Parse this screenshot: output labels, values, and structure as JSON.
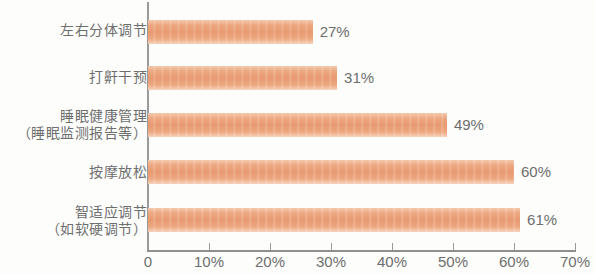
{
  "chart_data": {
    "type": "bar",
    "orientation": "horizontal",
    "title": "",
    "subtitle": "",
    "xlabel": "",
    "ylabel": "",
    "xlim": [
      0,
      70
    ],
    "grid": false,
    "legend": false,
    "bar_color": "#e89a70",
    "text_color": "#6e6e6e",
    "axis_color": "#9a9a9a",
    "background_color": "#fdfdfc",
    "categories": [
      "左右分体调节",
      "打鼾干预",
      "睡眠健康管理（睡眠监测报告等）",
      "按摩放松",
      "智适应调节（如软硬调节）"
    ],
    "category_lines": [
      [
        "左右分体调节"
      ],
      [
        "打鼾干预"
      ],
      [
        "睡眠健康管理",
        "（睡眠监测报告等）"
      ],
      [
        "按摩放松"
      ],
      [
        "智适应调节",
        "（如软硬调节）"
      ]
    ],
    "values": [
      27,
      31,
      49,
      60,
      61
    ],
    "value_labels": [
      "27%",
      "31%",
      "49%",
      "60%",
      "61%"
    ],
    "ticks": [
      0,
      10,
      20,
      30,
      40,
      50,
      60,
      70
    ],
    "tick_labels": [
      "0",
      "10%",
      "20%",
      "30%",
      "40%",
      "50%",
      "60%",
      "70%"
    ]
  }
}
